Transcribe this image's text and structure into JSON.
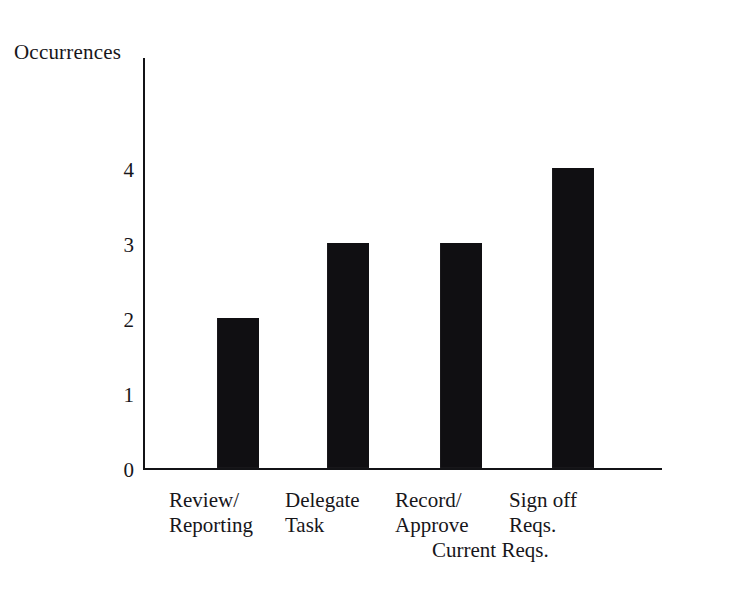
{
  "chart_data": {
    "type": "bar",
    "title": "",
    "subtitle": "",
    "xlabel": "",
    "ylabel": "Occurrences",
    "categories": [
      "Review/\nReporting",
      "Delegate\nTask",
      "Record/\nApprove",
      "Sign off\nReqs."
    ],
    "values": [
      2,
      3,
      3,
      4
    ],
    "ylim": [
      0,
      5.5
    ],
    "yticks": [
      "0",
      "1",
      "2",
      "3",
      "4"
    ],
    "ytick_values": [
      0,
      1,
      2,
      3,
      4
    ],
    "grid": false,
    "legend": null,
    "annotations": [
      {
        "text": "Current Reqs.",
        "note": "third line continuing the Record/Approve category label"
      }
    ],
    "bar_color": "#100f12",
    "axis_color": "#131316",
    "background_color": "#ffffff"
  },
  "figure": {
    "axis_title": "Occurrences",
    "extra_line": "Current Reqs."
  }
}
